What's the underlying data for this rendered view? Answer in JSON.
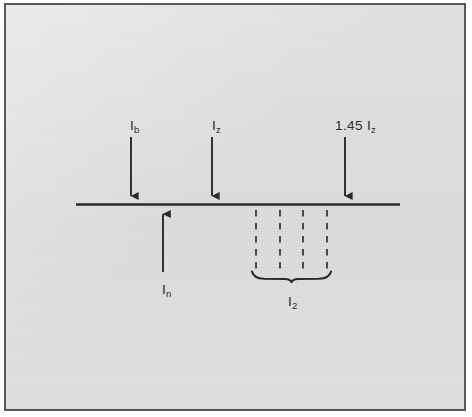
{
  "figure": {
    "type": "circuit-protection-coordination-diagram",
    "background_color": "#dedede",
    "border_color": "#595959",
    "ink_color": "#2a2a2a"
  },
  "axis": {
    "name": "current-axis",
    "x_start": 76,
    "x_end": 400,
    "y": 204
  },
  "arrows": [
    {
      "id": "ib",
      "label_main": "I",
      "label_sub": "b",
      "direction": "down",
      "x": 131,
      "y_tail": 137,
      "y_head": 203,
      "label_x": 124,
      "label_y": 114
    },
    {
      "id": "iz",
      "label_main": "I",
      "label_sub": "z",
      "direction": "down",
      "x": 212,
      "y_tail": 137,
      "y_head": 203,
      "label_x": 206,
      "label_y": 114
    },
    {
      "id": "145iz",
      "label_prefix": "1.45 ",
      "label_main": "I",
      "label_sub": "z",
      "direction": "down",
      "x": 345,
      "y_tail": 137,
      "y_head": 203,
      "label_x": 329,
      "label_y": 114
    },
    {
      "id": "in",
      "label_main": "I",
      "label_sub": "n",
      "direction": "up",
      "x": 163,
      "y_tail": 272,
      "y_head": 206,
      "label_x": 156,
      "label_y": 278
    }
  ],
  "dashed_lines": {
    "name": "tolerance-band-guides",
    "y_top": 209,
    "y_bottom": 270,
    "x_positions": [
      256,
      280,
      303,
      327
    ]
  },
  "brace": {
    "name": "i2-range-brace",
    "x_left": 252,
    "x_right": 332,
    "y": 274,
    "label_main": "I",
    "label_sub": "2",
    "label_x": 286,
    "label_y": 290
  }
}
